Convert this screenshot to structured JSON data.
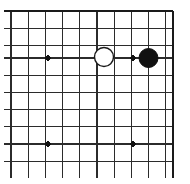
{
  "figure": {
    "kind": "go-board-diagram",
    "background_color": "#ffffff",
    "line_color": "#2b2b2b",
    "edge_line_color": "#1a1a1a",
    "black_stone_color": "#111111",
    "white_stone_fill": "#ffffff",
    "white_stone_stroke": "#1a1a1a"
  },
  "board": {
    "origin_x": 11,
    "origin_y": 11,
    "spacing": 17.2,
    "vertical_lines": 10,
    "horizontal_lines": 10,
    "edge_top": true,
    "edge_right": true,
    "edge_bottom_cropped": true,
    "edge_left_cropped": true,
    "edge_stroke_width": 2.6,
    "grid_stroke_width": 1.1
  },
  "star_points": {
    "radius": 2.6,
    "points": [
      {
        "name": "star-point-upper-left",
        "cx": 48,
        "cy": 58
      },
      {
        "name": "star-point-upper-right",
        "cx": 133,
        "cy": 58
      },
      {
        "name": "star-point-lower-left",
        "cx": 48,
        "cy": 144
      },
      {
        "name": "star-point-lower-right",
        "cx": 133,
        "cy": 144
      }
    ]
  },
  "stones": {
    "radius": 9.5,
    "items": [
      {
        "name": "white-stone",
        "color_label": "White",
        "cx": 104,
        "cy": 57,
        "fill": "#ffffff",
        "stroke": "#1a1a1a",
        "stroke_width": 1.4
      },
      {
        "name": "black-stone",
        "color_label": "Black",
        "cx": 148.5,
        "cy": 58,
        "fill": "#111111",
        "stroke": "#111111",
        "stroke_width": 1
      }
    ]
  },
  "grid_geometry": {
    "vertical_x": [
      11,
      28.2,
      45.4,
      62.6,
      79.8,
      97,
      114.2,
      131.4,
      148.6,
      165.8
    ],
    "vertical_x_edge": 173,
    "horizontal_y": [
      11,
      28.2,
      45.4,
      58,
      75.2,
      92.4,
      109.6,
      126.8,
      144,
      161.2
    ],
    "vertical_top": 11,
    "vertical_bottom": 178,
    "horizontal_left": 4,
    "horizontal_right": 173
  }
}
